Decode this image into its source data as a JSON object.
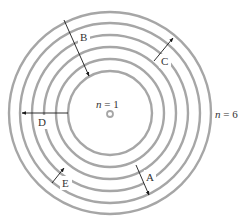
{
  "diagram": {
    "center": [
      110,
      113
    ],
    "orbit_color": "#a6a6a6",
    "arrow_color": "#1a1a1a",
    "orbits": [
      {
        "n": 1,
        "r": 42
      },
      {
        "n": 2,
        "r": 54
      },
      {
        "n": 3,
        "r": 66
      },
      {
        "n": 4,
        "r": 78
      },
      {
        "n": 5,
        "r": 90
      },
      {
        "n": 6,
        "r": 101
      }
    ],
    "labels": {
      "inner_var": "n",
      "inner_eq": " = 1",
      "outer_var": "n",
      "outer_eq": " = 6"
    },
    "transitions": [
      {
        "label": "A",
        "from": [
          136,
          165
        ],
        "to": [
          149,
          195
        ],
        "label_pos": [
          146,
          172
        ]
      },
      {
        "label": "B",
        "from": [
          64,
          20
        ],
        "to": [
          89,
          76
        ],
        "label_pos": [
          80,
          32
        ]
      },
      {
        "label": "C",
        "from": [
          154,
          61
        ],
        "to": [
          173,
          38
        ],
        "label_pos": [
          161,
          56
        ]
      },
      {
        "label": "D",
        "from": [
          68,
          113
        ],
        "to": [
          22,
          113
        ],
        "label_pos": [
          38,
          117
        ]
      },
      {
        "label": "E",
        "from": [
          52,
          183
        ],
        "to": [
          64,
          168
        ],
        "label_pos": [
          62,
          178
        ]
      }
    ]
  }
}
